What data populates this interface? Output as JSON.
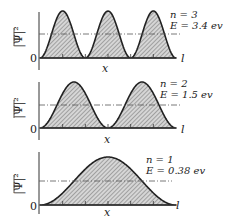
{
  "diagram": {
    "panels": [
      {
        "n": 3,
        "quantum_label": "n = 3",
        "energy_label": "E = 3.4 ev",
        "y_label": "|Ψ|²",
        "x_label": "x",
        "origin_label": "0",
        "end_label": "l"
      },
      {
        "n": 2,
        "quantum_label": "n = 2",
        "energy_label": "E = 1.5 ev",
        "y_label": "|Ψ|²",
        "x_label": "x",
        "origin_label": "0",
        "end_label": "l"
      },
      {
        "n": 1,
        "quantum_label": "n = 1",
        "energy_label": "E = 0.38 ev",
        "y_label": "|Ψ|²",
        "x_label": "x",
        "origin_label": "0",
        "end_label": "l"
      }
    ],
    "colors": {
      "curve": "#222222",
      "hatch": "#555555",
      "fill": "#d9d9d9",
      "dash": "#555555"
    }
  }
}
